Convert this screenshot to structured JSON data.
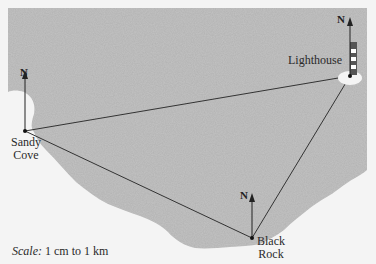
{
  "diagram": {
    "type": "map-bearing-triangle",
    "colors": {
      "sea": "#c3c3c3",
      "land": "#f4f4f4",
      "line": "#333333",
      "lighthouse_dark": "#555555",
      "lighthouse_light": "#ffffff"
    },
    "locations": [
      {
        "id": "sandy-cove",
        "label_line1": "Sandy",
        "label_line2": "Cove",
        "x": 25,
        "y": 131
      },
      {
        "id": "lighthouse",
        "label_line1": "Lighthouse",
        "x": 350,
        "y": 76
      },
      {
        "id": "black-rock",
        "label_line1": "Black",
        "label_line2": "Rock",
        "x": 252,
        "y": 238
      }
    ],
    "north_label": "N",
    "edges": [
      [
        "sandy-cove",
        "lighthouse"
      ],
      [
        "sandy-cove",
        "black-rock"
      ],
      [
        "black-rock",
        "lighthouse"
      ]
    ],
    "scale": {
      "prefix": "Scale:",
      "text": "1 cm to 1 km"
    }
  }
}
